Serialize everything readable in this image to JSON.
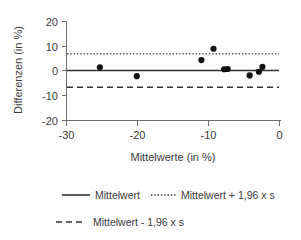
{
  "chart_data": {
    "type": "scatter",
    "title": "",
    "xlabel": "Mittelwerte (in %)",
    "ylabel": "Differenzen (in %)",
    "xlim": [
      -30,
      0
    ],
    "ylim": [
      -20,
      20
    ],
    "xticks": [
      -30,
      -20,
      -10,
      0
    ],
    "xtick_labels": [
      "-30",
      "-20",
      "-10",
      "0"
    ],
    "yticks": [
      20,
      10,
      0,
      -10,
      -20
    ],
    "ytick_labels": [
      "20",
      "10",
      "0",
      "-10",
      "-20"
    ],
    "grid": false,
    "legend_position": "bottom",
    "series": [
      {
        "name": "Differenzen",
        "marker": "circle",
        "color": "#111111",
        "x": [
          -25.3,
          -20.1,
          -11.0,
          -9.3,
          -7.8,
          -7.3,
          -4.2,
          -2.9,
          -2.4
        ],
        "y": [
          1.5,
          -2.1,
          4.4,
          9.0,
          0.7,
          0.8,
          -1.8,
          -0.3,
          1.7
        ]
      }
    ],
    "reference_lines": [
      {
        "name": "Mittelwert",
        "value": -0.05,
        "style": "solid",
        "color": "#333333"
      },
      {
        "name": "Mittelwert + 1,96 x s",
        "value": 6.6,
        "style": "dotted",
        "color": "#333333"
      },
      {
        "name": "Mittelwert - 1,96 x s",
        "value": -6.7,
        "style": "dashed",
        "color": "#333333"
      }
    ]
  },
  "legend": {
    "entries": [
      {
        "label": "Mittelwert",
        "style": "solid"
      },
      {
        "label": "Mittelwert + 1,96 x s",
        "style": "dotted"
      },
      {
        "label": "Mittelwert - 1,96 x s",
        "style": "dashed"
      }
    ]
  }
}
